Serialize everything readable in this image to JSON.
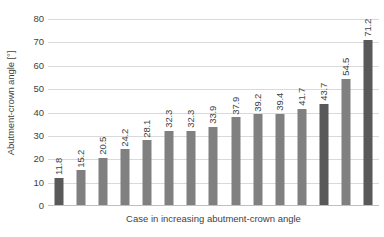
{
  "chart_data": {
    "type": "bar",
    "title": "",
    "xlabel": "Case in increasing abutment-crown angle",
    "ylabel": "Abutment-crown angle [°]",
    "ylim": [
      0,
      80
    ],
    "ytick_step": 10,
    "yticks": [
      "0",
      "10",
      "20",
      "30",
      "40",
      "50",
      "60",
      "70",
      "80"
    ],
    "grid": true,
    "legend": "none",
    "xtick_labels": [],
    "categories": [
      "1",
      "2",
      "3",
      "4",
      "5",
      "6",
      "7",
      "8",
      "9",
      "10",
      "11",
      "12",
      "13",
      "14",
      "15"
    ],
    "values": [
      11.8,
      15.2,
      20.5,
      24.2,
      28.1,
      32.3,
      32.3,
      33.9,
      37.9,
      39.2,
      39.4,
      41.7,
      43.7,
      54.5,
      71.2
    ],
    "data_labels": [
      "11.8",
      "15.2",
      "20.5",
      "24.2",
      "28.1",
      "32.3",
      "32.3",
      "33.9",
      "37.9",
      "39.2",
      "39.4",
      "41.7",
      "43.7",
      "54.5",
      "71.2"
    ],
    "bar_shades": [
      "dark",
      "light",
      "light",
      "light",
      "light",
      "light",
      "light",
      "light",
      "light",
      "light",
      "light",
      "light",
      "dark",
      "light",
      "dark"
    ],
    "colors": {
      "bar_dark": "#595959",
      "bar_light": "#808080",
      "gridline": "#d9d9d9",
      "axis": "#bfbfbf",
      "text": "#3f3f3f",
      "background": "#ffffff"
    }
  }
}
